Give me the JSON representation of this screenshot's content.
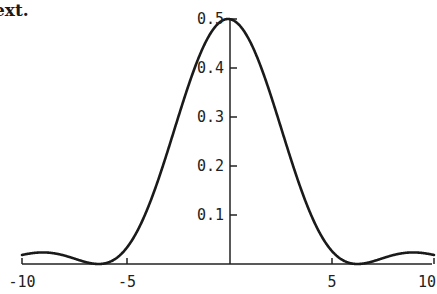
{
  "page": {
    "text_fragment": "ext.",
    "background_color": "#ffffff",
    "ink_color": "#1a1a1a"
  },
  "figure": {
    "name": "sinc-squared-diffraction-plot",
    "axis_color": "#222222",
    "curve_color": "#1a1a1a",
    "curve_width_px": 2.6,
    "axis_width_px": 1.4
  },
  "chart_data": {
    "type": "line",
    "title": "",
    "subtitle": "",
    "xlabel": "",
    "ylabel": "",
    "legend": [],
    "grid": false,
    "legend_position": "none",
    "xlim": [
      -10,
      10
    ],
    "ylim": [
      0,
      0.52
    ],
    "xticks": [
      -10,
      -5,
      0,
      5,
      10
    ],
    "xticklabels": [
      "-10",
      "-5",
      "",
      "5",
      "10"
    ],
    "yticks": [
      0.1,
      0.2,
      0.3,
      0.4,
      0.5
    ],
    "yticklabels": [
      "0.1",
      "0.2",
      "0.3",
      "0.4",
      "0.5"
    ],
    "y_axis_position_x": 0,
    "x_axis_position_y": 0,
    "ytick_side": "right",
    "peak_value": 0.5,
    "peak_x": 0,
    "zero_crossings": [
      -12.566,
      -6.283,
      6.283,
      12.566
    ],
    "sidelobe_peaks": [
      {
        "x": -8.99,
        "y": 0.0162
      },
      {
        "x": 8.99,
        "y": 0.0162
      }
    ],
    "function": "0.5*(sin(x/2)/(x/2))^2",
    "series": [
      {
        "name": "intensity",
        "x": [
          -10.0,
          -9.8,
          -9.6,
          -9.4,
          -9.2,
          -9.0,
          -8.8,
          -8.6,
          -8.4,
          -8.2,
          -8.0,
          -7.8,
          -7.6,
          -7.4,
          -7.2,
          -7.0,
          -6.8,
          -6.6,
          -6.4,
          -6.2,
          -6.0,
          -5.8,
          -5.6,
          -5.4,
          -5.2,
          -5.0,
          -4.8,
          -4.6,
          -4.4,
          -4.2,
          -4.0,
          -3.8,
          -3.6,
          -3.4,
          -3.2,
          -3.0,
          -2.8,
          -2.6,
          -2.4,
          -2.2,
          -2.0,
          -1.8,
          -1.6,
          -1.4,
          -1.2,
          -1.0,
          -0.8,
          -0.6,
          -0.4,
          -0.2,
          0.0,
          0.2,
          0.4,
          0.6,
          0.8,
          1.0,
          1.2,
          1.4,
          1.6,
          1.8,
          2.0,
          2.2,
          2.4,
          2.6,
          2.8,
          3.0,
          3.2,
          3.4,
          3.6,
          3.8,
          4.0,
          4.2,
          4.4,
          4.6,
          4.8,
          5.0,
          5.2,
          5.4,
          5.6,
          5.8,
          6.0,
          6.2,
          6.4,
          6.6,
          6.8,
          7.0,
          7.2,
          7.4,
          7.6,
          7.8,
          8.0,
          8.2,
          8.4,
          8.6,
          8.8,
          9.0,
          9.2,
          9.4,
          9.6,
          9.8,
          10.0
        ],
        "values": [
          0.0133,
          0.01523,
          0.01637,
          0.01663,
          0.01604,
          0.01469,
          0.01276,
          0.01048,
          0.00809,
          0.00583,
          0.00389,
          0.00239,
          0.00136,
          0.00074,
          0.00041,
          0.00026,
          0.00017,
          9e-05,
          2e-05,
          0.0,
          0.00017,
          0.00077,
          0.00196,
          0.00387,
          0.00655,
          0.00996,
          0.01401,
          0.01855,
          0.0234,
          0.02835,
          0.03318,
          0.0377,
          0.04173,
          0.04516,
          0.04797,
          0.05048,
          0.05465,
          0.06343,
          0.07931,
          0.10345,
          0.13529,
          0.17294,
          0.21365,
          0.25447,
          0.29267,
          0.32606,
          0.35313,
          0.37303,
          0.38552,
          0.39181,
          0.5,
          0.49834,
          0.49337,
          0.48518,
          0.47389,
          0.4597,
          0.44283,
          0.42357,
          0.40222,
          0.37914,
          0.3547,
          0.3293,
          0.30334,
          0.27722,
          0.25133,
          0.22605,
          0.20174,
          0.17872,
          0.15727,
          0.13762,
          0.11997,
          0.10443,
          0.09108,
          0.07994,
          0.07095,
          0.06402,
          0.05898,
          0.05562,
          0.05368,
          0.05285,
          0.05282,
          0.05324,
          0.05376,
          0.05404,
          0.05377,
          0.0527,
          0.05061,
          0.04737,
          0.04293,
          0.03731,
          0.03064,
          0.02313,
          0.0151,
          0.00692,
          0.0,
          0.0,
          0.00389,
          0.00809,
          0.01276,
          0.01604,
          0.01663
        ]
      }
    ]
  }
}
